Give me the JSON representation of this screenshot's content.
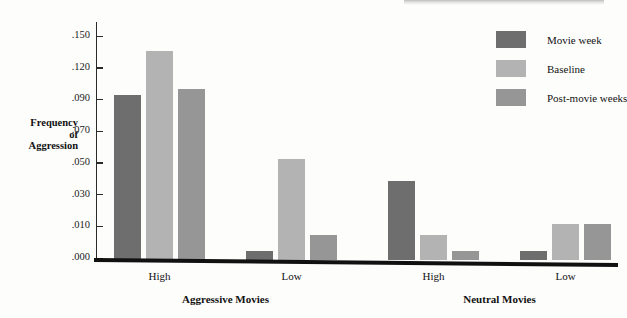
{
  "chart_data": {
    "type": "bar",
    "title": "",
    "xlabel": "",
    "ylabel": "Frequency of Aggression",
    "ylabel_lines": [
      "Frequency",
      "of",
      "Aggression"
    ],
    "categories": [
      "High",
      "Low",
      "High",
      "Low"
    ],
    "group_labels": [
      "Aggressive Movies",
      "Neutral Movies"
    ],
    "grid": false,
    "legend_position": "top-right",
    "ylim": [
      0.0,
      0.15
    ],
    "yticks": [
      0.0,
      0.01,
      0.03,
      0.05,
      0.07,
      0.09,
      0.12,
      0.15
    ],
    "ytick_labels": [
      ".000",
      ".010",
      ".030",
      ".050",
      ".070",
      ".090",
      ".120",
      ".150"
    ],
    "series": [
      {
        "name": "Movie week",
        "color": "#6e6e6e",
        "values": [
          0.096,
          0.003,
          0.04,
          0.003
        ]
      },
      {
        "name": "Baseline",
        "color": "#b3b3b3",
        "values": [
          0.138,
          0.054,
          0.008,
          0.013
        ]
      },
      {
        "name": "Post-movie weeks",
        "color": "#969696",
        "values": [
          0.102,
          0.008,
          0.003,
          0.013
        ]
      }
    ]
  },
  "legend": {
    "items": [
      {
        "label": "Movie week",
        "color": "#6e6e6e"
      },
      {
        "label": "Baseline",
        "color": "#b3b3b3"
      },
      {
        "label": "Post-movie weeks",
        "color": "#969696"
      }
    ]
  },
  "axis": {
    "y_label_lines": [
      "Frequency",
      "of",
      "Aggression"
    ],
    "y_tick_labels": [
      ".150",
      ".120",
      ".090",
      ".070",
      ".050",
      ".030",
      ".010",
      ".000"
    ]
  },
  "x_axis": {
    "category_labels": [
      "High",
      "Low",
      "High",
      "Low"
    ],
    "group_labels": [
      "Aggressive Movies",
      "Neutral Movies"
    ]
  }
}
